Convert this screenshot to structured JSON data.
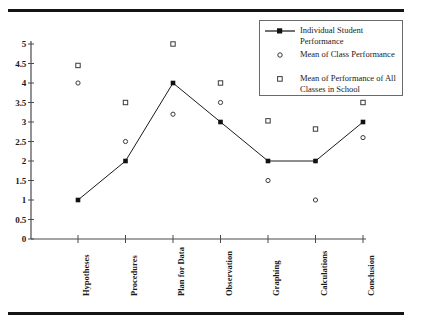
{
  "figure": {
    "name": "student-performance-line-chart",
    "top_rule": true,
    "bottom_rule": true
  },
  "legend": {
    "position": "top-right",
    "items": [
      {
        "label": "Individual Student Performance",
        "marker": "line-filled-square"
      },
      {
        "label": "Mean of Class Performance",
        "marker": "open-circle"
      },
      {
        "label": "Mean of Performance of All Classes in School",
        "marker": "open-square"
      }
    ]
  },
  "axis": {
    "y_ticks": [
      "5",
      "4.5",
      "4",
      "3.5",
      "3",
      "2.5",
      "2",
      "1.5",
      "1",
      "0.5",
      "0"
    ],
    "y_min": 0,
    "y_max": 5
  },
  "chart_data": {
    "type": "line",
    "title": "",
    "xlabel": "",
    "ylabel": "",
    "ylim": [
      0,
      5
    ],
    "ytick_step": 0.5,
    "grid": false,
    "legend_position": "top-right",
    "categories": [
      "Hypotheses",
      "Procedures",
      "Plan for Data",
      "Observation",
      "Graphing",
      "Calculations",
      "Conclusion"
    ],
    "series": [
      {
        "name": "Individual Student Performance",
        "marker": "filled-square",
        "line": true,
        "color": "#1a1a1a",
        "values": [
          1,
          2,
          4,
          3,
          2,
          2,
          3
        ]
      },
      {
        "name": "Mean of Class Performance",
        "marker": "open-circle",
        "line": false,
        "color": "#1a1a1a",
        "values": [
          4,
          2.5,
          3.2,
          3.5,
          1.5,
          1,
          2.6
        ]
      },
      {
        "name": "Mean of Performance of All Classes in School",
        "marker": "open-square",
        "line": false,
        "color": "#1a1a1a",
        "values": [
          4.45,
          3.5,
          5,
          4,
          3.03,
          2.82,
          3.5
        ]
      }
    ]
  }
}
